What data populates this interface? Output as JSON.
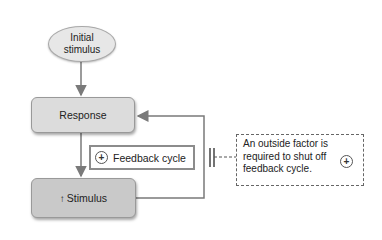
{
  "diagram": {
    "type": "positive-feedback-loop",
    "nodes": {
      "initial": {
        "label_line1": "Initial",
        "label_line2": "stimulus"
      },
      "response": {
        "label": "Response"
      },
      "stimulus": {
        "arrow_glyph": "↑",
        "label": "Stimulus"
      }
    },
    "feedback_label": {
      "sign": "+",
      "label": "Feedback cycle"
    },
    "note": {
      "text": "An outside factor is required to shut off feedback cycle.",
      "sign": "+"
    },
    "edges": [
      {
        "from": "Initial stimulus",
        "to": "Response"
      },
      {
        "from": "Response",
        "to": "Stimulus"
      },
      {
        "from": "Stimulus",
        "to": "Response",
        "note": "loop back, blocked by outside factor"
      }
    ],
    "colors": {
      "line": "#7a7a7a",
      "box_fill": "#d6d6d6",
      "stimulus_fill": "#c9c9c9",
      "ellipse_fill": "#e7e7e7"
    }
  }
}
